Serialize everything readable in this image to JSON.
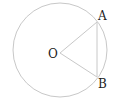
{
  "diagram": {
    "type": "circle-geometry",
    "circle": {
      "cx": 60,
      "cy": 50,
      "r": 47,
      "stroke": "#c8c8c8"
    },
    "points": {
      "O": {
        "label": "O",
        "x": 60,
        "y": 53
      },
      "A": {
        "label": "A",
        "x": 97,
        "y": 22
      },
      "B": {
        "label": "B",
        "x": 97,
        "y": 77
      }
    },
    "segments": [
      "OA",
      "OB",
      "AB"
    ],
    "line_color": "#c8c8c8",
    "label_color": "#222222"
  }
}
